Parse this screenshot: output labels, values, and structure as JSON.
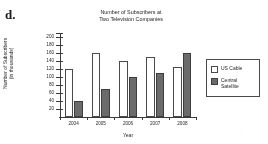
{
  "problem": {
    "label": "d."
  },
  "chart_data": {
    "type": "bar",
    "title": "Number of Subscribers at\nTwo Television Companies",
    "xlabel": "Year",
    "ylabel": "Number of Subscribers\n(in thousands)",
    "categories": [
      "2004",
      "2005",
      "2006",
      "2007",
      "2008"
    ],
    "series": [
      {
        "name": "US Cable",
        "color": "#ffffff",
        "values": [
          120,
          160,
          140,
          150,
          125
        ]
      },
      {
        "name": "Central\nSatellite",
        "color": "#6b6b6b",
        "values": [
          40,
          70,
          100,
          110,
          160
        ]
      }
    ],
    "ylim": [
      0,
      210
    ],
    "ytick_labels": [
      "200",
      "180",
      "160",
      "140",
      "120",
      "100",
      "80",
      "60",
      "40",
      "20"
    ],
    "ytick_values": [
      200,
      180,
      160,
      140,
      120,
      100,
      80,
      60,
      40,
      20
    ],
    "grid": false,
    "legend_position": "right"
  }
}
